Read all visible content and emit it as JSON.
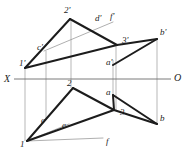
{
  "figure": {
    "type": "descriptive-geometry-projection",
    "background_color": "#ffffff",
    "stroke_color": "#1c1c1c",
    "thin_stroke_color": "#8d8d8d",
    "axis_color": "#6b6b6b",
    "projector_color": "#9a9a9a",
    "stroke_width_heavy": 2.0,
    "stroke_width_thin": 0.7,
    "stroke_width_axis": 0.9
  },
  "axis": {
    "name": "ground-line",
    "label_left": "X",
    "label_right": "O",
    "y": 79,
    "x_start": 14,
    "x_end": 171,
    "label_left_pos": {
      "x": 4,
      "y": 80
    },
    "label_right_pos": {
      "x": 174,
      "y": 79
    }
  },
  "labels": [
    {
      "id": "2p",
      "text": "2'",
      "x": 64,
      "y": 11
    },
    {
      "id": "dp",
      "text": "d'",
      "x": 95,
      "y": 19
    },
    {
      "id": "fp",
      "text": "f'",
      "x": 110,
      "y": 17
    },
    {
      "id": "3p",
      "text": "3'",
      "x": 122,
      "y": 41
    },
    {
      "id": "bp",
      "text": "b'",
      "x": 160,
      "y": 33
    },
    {
      "id": "cp",
      "text": "c'",
      "x": 37,
      "y": 48
    },
    {
      "id": "1p",
      "text": "1'",
      "x": 19,
      "y": 64
    },
    {
      "id": "ap",
      "text": "a'",
      "x": 106,
      "y": 63
    },
    {
      "id": "2",
      "text": "2",
      "x": 67,
      "y": 84
    },
    {
      "id": "a",
      "text": "a",
      "x": 106,
      "y": 93
    },
    {
      "id": "3",
      "text": "3",
      "x": 120,
      "y": 113
    },
    {
      "id": "b",
      "text": "b",
      "x": 160,
      "y": 119
    },
    {
      "id": "c",
      "text": "c",
      "x": 41,
      "y": 121
    },
    {
      "id": "e",
      "text": "e",
      "x": 62,
      "y": 126
    },
    {
      "id": "1",
      "text": "1",
      "x": 20,
      "y": 145
    },
    {
      "id": "f",
      "text": "f",
      "x": 106,
      "y": 142
    }
  ],
  "points": {
    "1p": {
      "x": 25,
      "y": 68
    },
    "2p": {
      "x": 70,
      "y": 19
    },
    "3p": {
      "x": 117,
      "y": 45
    },
    "cp": {
      "x": 44,
      "y": 51
    },
    "dp": {
      "x": 99,
      "y": 25
    },
    "fp": {
      "x": 113,
      "y": 22
    },
    "ap": {
      "x": 113,
      "y": 65
    },
    "bp": {
      "x": 157,
      "y": 39
    },
    "1": {
      "x": 27,
      "y": 141
    },
    "2": {
      "x": 73,
      "y": 88
    },
    "3": {
      "x": 114,
      "y": 110
    },
    "c": {
      "x": 47,
      "y": 118
    },
    "e": {
      "x": 69,
      "y": 124
    },
    "f": {
      "x": 103,
      "y": 138
    },
    "a": {
      "x": 113,
      "y": 95
    },
    "b": {
      "x": 157,
      "y": 124
    }
  },
  "heavy_polylines": [
    {
      "name": "upper-triangle-1p-2p",
      "pts": "25,68 70,19"
    },
    {
      "name": "upper-triangle-2p-3p",
      "pts": "70,19 117,45"
    },
    {
      "name": "upper-triangle-3p-1p",
      "pts": "117,45 25,68"
    },
    {
      "name": "upper-quad-ap-bp",
      "pts": "113,65 157,39"
    },
    {
      "name": "upper-quad-bp-3p-side",
      "pts": "157,39 117,45"
    },
    {
      "name": "lower-triangle-1-2",
      "pts": "27,141 73,88"
    },
    {
      "name": "lower-triangle-2-3",
      "pts": "73,88 114,110"
    },
    {
      "name": "lower-triangle-3-1",
      "pts": "114,110 27,141"
    },
    {
      "name": "lower-quad-a-b",
      "pts": "113,95 157,124"
    },
    {
      "name": "lower-quad-b-3-side",
      "pts": "157,124 114,110"
    },
    {
      "name": "lower-quad-a-3-side",
      "pts": "113,95 114,110"
    }
  ],
  "thin_lines": [
    {
      "name": "auxiliary-line-cp-fp",
      "pts": "44,51 113,22"
    },
    {
      "name": "auxiliary-line-1-f",
      "pts": "27,141 103,138"
    },
    {
      "name": "auxiliary-line-1-e-extend",
      "pts": "27,141 69,124"
    }
  ],
  "projectors": [
    {
      "name": "projector-point-1",
      "x": 25,
      "y1": 68,
      "y2": 141
    },
    {
      "name": "projector-point-2",
      "x": 71,
      "y1": 19,
      "y2": 88
    },
    {
      "name": "projector-point-3",
      "x": 116,
      "y1": 45,
      "y2": 110
    },
    {
      "name": "projector-point-a",
      "x": 113,
      "y1": 60,
      "y2": 99
    },
    {
      "name": "projector-point-b",
      "x": 157,
      "y1": 39,
      "y2": 124
    },
    {
      "name": "projector-point-c",
      "x": 46,
      "y1": 51,
      "y2": 118
    }
  ]
}
